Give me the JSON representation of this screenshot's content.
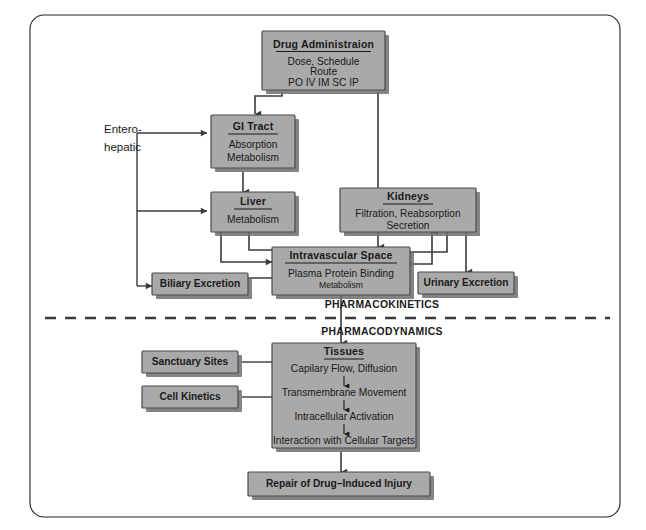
{
  "diagram": {
    "frame_color": "#222222",
    "box_fill_color": "#a9a9a9",
    "box_border_color": "#4a4a4a",
    "connector_color": "#3a3a3a",
    "sections": {
      "upper_label": "PHARMACOKINETICS",
      "lower_label": "PHARMACODYNAMICS"
    },
    "nodes": {
      "drug_administration": {
        "title": "Drug Administraion",
        "line1": "Dose, Schedule",
        "line2": "Route",
        "routes": "PO    IV    IM    SC    IP"
      },
      "gi_tract": {
        "title": "GI Tract",
        "line1": "Absorption",
        "line2": "Metabolism"
      },
      "enterohepatic": {
        "line1": "Entero-",
        "line2": "hepatic"
      },
      "liver": {
        "title": "Liver",
        "line1": "Metabolism"
      },
      "kidneys": {
        "title": "Kidneys",
        "line1": "Filtration, Reabsorption",
        "line2": "Secretion"
      },
      "intravascular_space": {
        "title": "Intravascular Space",
        "line1": "Plasma Protein Binding",
        "line2": "Metabolism"
      },
      "biliary_excretion": {
        "title": "Biliary Excretion"
      },
      "urinary_excretion": {
        "title": "Urinary Excretion"
      },
      "tissues": {
        "title": "Tissues",
        "step1": "Capilary Flow, Diffusion",
        "step2": "Transmembrane Movement",
        "step3": "Intracellular Activation",
        "step4": "Interaction with Cellular Targets"
      },
      "sanctuary_sites": {
        "title": "Sanctuary Sites"
      },
      "cell_kinetics": {
        "title": "Cell Kinetics"
      },
      "repair": {
        "title": "Repair of Drug–Induced Injury"
      }
    }
  }
}
